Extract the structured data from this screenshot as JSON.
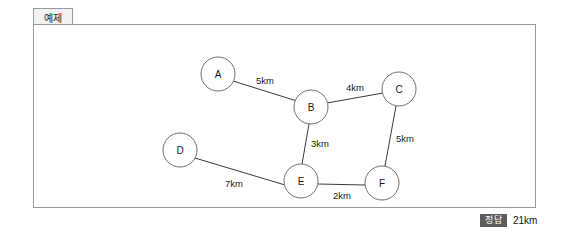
{
  "tab": {
    "label": "예제"
  },
  "answer": {
    "badge": "정답",
    "value": "21km"
  },
  "graph": {
    "nodes": [
      {
        "id": "A",
        "label": "A",
        "cx": 184,
        "cy": 49,
        "r": 17
      },
      {
        "id": "B",
        "label": "B",
        "cx": 277,
        "cy": 82,
        "r": 17
      },
      {
        "id": "C",
        "label": "C",
        "cx": 365,
        "cy": 64,
        "r": 17
      },
      {
        "id": "D",
        "label": "D",
        "cx": 146,
        "cy": 125,
        "r": 17
      },
      {
        "id": "E",
        "label": "E",
        "cx": 267,
        "cy": 156,
        "r": 17
      },
      {
        "id": "F",
        "label": "F",
        "cx": 348,
        "cy": 158,
        "r": 17
      }
    ],
    "edges": [
      {
        "from": "A",
        "to": "B",
        "weight": "5km",
        "x1": 199,
        "y1": 56,
        "x2": 263,
        "y2": 76,
        "lx": 231,
        "ly": 55
      },
      {
        "from": "B",
        "to": "C",
        "weight": "4km",
        "x1": 293,
        "y1": 78,
        "x2": 349,
        "y2": 68,
        "lx": 321,
        "ly": 62
      },
      {
        "from": "B",
        "to": "E",
        "weight": "3km",
        "x1": 275,
        "y1": 99,
        "x2": 268,
        "y2": 139,
        "lx": 286,
        "ly": 118
      },
      {
        "from": "C",
        "to": "F",
        "weight": "5km",
        "x1": 362,
        "y1": 81,
        "x2": 351,
        "y2": 141,
        "lx": 371,
        "ly": 113
      },
      {
        "from": "D",
        "to": "E",
        "weight": "7km",
        "x1": 161,
        "y1": 133,
        "x2": 251,
        "y2": 160,
        "lx": 200,
        "ly": 158
      },
      {
        "from": "E",
        "to": "F",
        "weight": "2km",
        "x1": 284,
        "y1": 159,
        "x2": 331,
        "y2": 160,
        "lx": 308,
        "ly": 170
      }
    ]
  }
}
